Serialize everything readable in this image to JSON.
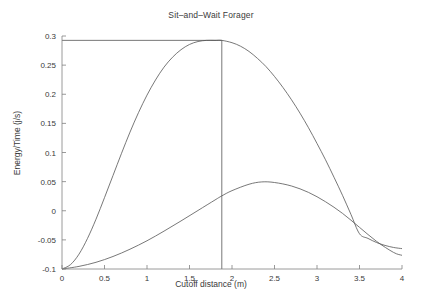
{
  "chart_data": {
    "type": "line",
    "title": "Sit–and–Wait Forager",
    "xlabel": "Cutoff distance (m)",
    "ylabel": "Energy/Time (j/s)",
    "xlim": [
      0,
      4
    ],
    "ylim": [
      -0.1,
      0.3
    ],
    "xticks": [
      0,
      0.5,
      1,
      1.5,
      2,
      2.5,
      3,
      3.5,
      4
    ],
    "xtick_labels": [
      "0",
      "0.5",
      "1",
      "1.5",
      "2",
      "2.5",
      "3",
      "3.5",
      "4"
    ],
    "yticks": [
      -0.1,
      -0.05,
      0,
      0.05,
      0.1,
      0.15,
      0.2,
      0.25,
      0.3
    ],
    "ytick_labels": [
      "-0.1",
      "-0.05",
      "0",
      "0.05",
      "0.1",
      "0.15",
      "0.2",
      "0.25",
      "0.3"
    ],
    "grid": false,
    "legend": null,
    "line_color": "#555555",
    "axis_color": "#808080",
    "text_color": "#3a3a3a",
    "series": [
      {
        "name": "upper-curve",
        "note": "Main energy/time curve peaking at optimum cutoff distance",
        "x": [
          0,
          0.1,
          0.2,
          0.3,
          0.4,
          0.5,
          0.6,
          0.7,
          0.8,
          0.9,
          1,
          1.1,
          1.2,
          1.3,
          1.4,
          1.5,
          1.6,
          1.7,
          1.8,
          1.88,
          2,
          2.1,
          2.2,
          2.3,
          2.4,
          2.5,
          2.6,
          2.7,
          2.8,
          2.9,
          3,
          3.1,
          3.2,
          3.3,
          3.4,
          3.5,
          3.6,
          3.7,
          3.8,
          3.9,
          4
        ],
        "y": [
          -0.1,
          -0.0925,
          -0.0745,
          -0.0475,
          -0.0145,
          0.0225,
          0.0605,
          0.0985,
          0.135,
          0.1685,
          0.1985,
          0.2245,
          0.2465,
          0.2635,
          0.2765,
          0.2855,
          0.2905,
          0.2925,
          0.2925,
          0.2925,
          0.2885,
          0.2825,
          0.2735,
          0.2615,
          0.2475,
          0.2305,
          0.2115,
          0.1905,
          0.1675,
          0.1425,
          0.1155,
          0.0875,
          0.0575,
          0.0265,
          -0.0065,
          -0.0395,
          -0.0475,
          -0.0545,
          -0.0595,
          -0.063,
          -0.065
        ]
      },
      {
        "name": "lower-curve",
        "note": "Secondary curve peaking near 2.35 m at about 0.05 j/s",
        "x": [
          0,
          0.2,
          0.4,
          0.6,
          0.8,
          1,
          1.2,
          1.4,
          1.6,
          1.8,
          1.88,
          2,
          2.2,
          2.35,
          2.5,
          2.7,
          2.9,
          3.1,
          3.3,
          3.5,
          3.7,
          3.9,
          4
        ],
        "y": [
          -0.1,
          -0.0955,
          -0.0885,
          -0.0785,
          -0.066,
          -0.0515,
          -0.035,
          -0.0175,
          0.0005,
          0.0185,
          0.0255,
          0.0345,
          0.0455,
          0.0495,
          0.0485,
          0.0425,
          0.0315,
          0.0155,
          -0.0045,
          -0.0285,
          -0.0525,
          -0.0715,
          -0.0765
        ]
      }
    ],
    "annotations": [
      {
        "name": "optimum-vertical-line",
        "type": "vline",
        "x": 1.88,
        "y_from": -0.1,
        "y_to": 0.2925
      },
      {
        "name": "optimum-horizontal-line",
        "type": "hline",
        "y": 0.2925,
        "x_from": 0,
        "x_to": 1.88
      }
    ]
  }
}
